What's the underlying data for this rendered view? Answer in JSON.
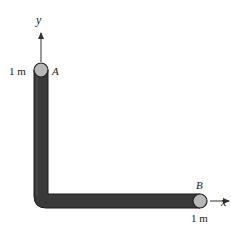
{
  "diagram": {
    "axes": {
      "y_label": "y",
      "x_label": "x"
    },
    "points": {
      "A": {
        "label": "A",
        "coord_label": "1 m"
      },
      "B": {
        "label": "B",
        "coord_label": "1 m"
      }
    },
    "colors": {
      "rod": "#3a3a3a",
      "rod_edge": "#1a1a1a",
      "joint": "#b8b8b8",
      "axis": "#333333"
    }
  }
}
